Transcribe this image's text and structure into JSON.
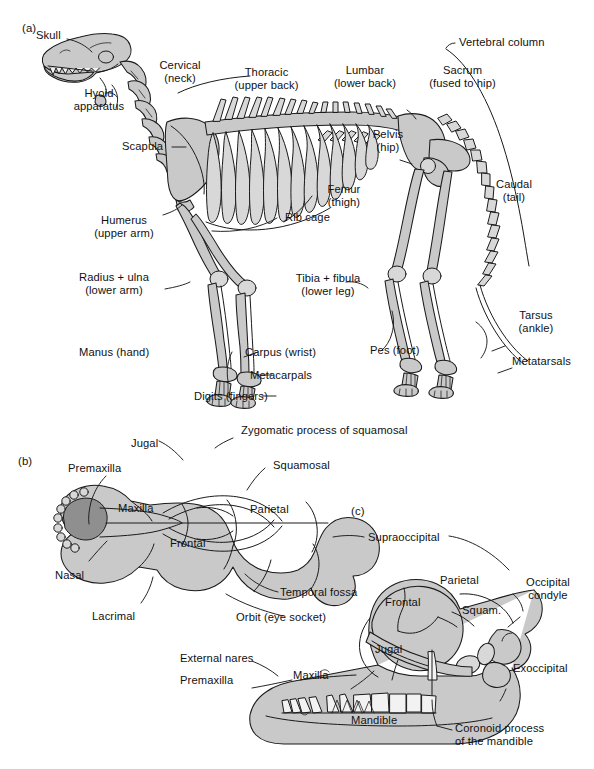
{
  "figure": {
    "background_color": "#ffffff",
    "bone_fill_color": "#c9c9c9",
    "bone_dark_fill_color": "#8f8f8f",
    "outline_color": "#1a1a1a",
    "text_color": "#111111"
  },
  "panels": {
    "a": {
      "tag": "(a)",
      "caption": "Whole skeleton, lateral view",
      "labels": [
        {
          "id": "skull",
          "text": "Skull"
        },
        {
          "id": "hyoid-apparatus",
          "text": "Hyoid\napparatus"
        },
        {
          "id": "scapula",
          "text": "Scapula"
        },
        {
          "id": "cervical",
          "text": "Cervical\n(neck)"
        },
        {
          "id": "thoracic",
          "text": "Thoracic\n(upper back)"
        },
        {
          "id": "lumbar",
          "text": "Lumbar\n(lower back)"
        },
        {
          "id": "sacrum",
          "text": "Sacrum\n(fused to hip)"
        },
        {
          "id": "vertebral-column",
          "text": "Vertebral column"
        },
        {
          "id": "pelvis",
          "text": "Pelvis\n(hip)"
        },
        {
          "id": "femur",
          "text": "Femur\n(thigh)"
        },
        {
          "id": "caudal",
          "text": "Caudal\n(tail)"
        },
        {
          "id": "rib-cage",
          "text": "Rib cage"
        },
        {
          "id": "humerus",
          "text": "Humerus\n(upper arm)"
        },
        {
          "id": "radius-ulna",
          "text": "Radius + ulna\n(lower arm)"
        },
        {
          "id": "manus",
          "text": "Manus (hand)"
        },
        {
          "id": "carpus",
          "text": "Carpus (wrist)"
        },
        {
          "id": "metacarpals",
          "text": "Metacarpals"
        },
        {
          "id": "digits",
          "text": "Digits (fingers)"
        },
        {
          "id": "tibia-fibula",
          "text": "Tibia + fibula\n(lower leg)"
        },
        {
          "id": "pes",
          "text": "Pes (foot)"
        },
        {
          "id": "tarsus",
          "text": "Tarsus\n(ankle)"
        },
        {
          "id": "metatarsals",
          "text": "Metatarsals"
        }
      ]
    },
    "b": {
      "tag": "(b)",
      "caption": "Skull, dorsal view",
      "labels": [
        {
          "id": "jugal",
          "text": "Jugal"
        },
        {
          "id": "zygomatic-process",
          "text": "Zygomatic process of squamosal"
        },
        {
          "id": "squamosal",
          "text": "Squamosal"
        },
        {
          "id": "premaxilla",
          "text": "Premaxilla"
        },
        {
          "id": "maxilla",
          "text": "Maxilla"
        },
        {
          "id": "parietal",
          "text": "Parietal"
        },
        {
          "id": "frontal",
          "text": "Frontal"
        },
        {
          "id": "nasal",
          "text": "Nasal"
        },
        {
          "id": "lacrimal",
          "text": "Lacrimal"
        },
        {
          "id": "temporal-fossa",
          "text": "Temporal fossa"
        },
        {
          "id": "orbit",
          "text": "Orbit (eye socket)"
        }
      ]
    },
    "c": {
      "tag": "(c)",
      "caption": "Skull, lateral view",
      "labels": [
        {
          "id": "supraoccipital",
          "text": "Supraoccipital"
        },
        {
          "id": "parietal",
          "text": "Parietal"
        },
        {
          "id": "frontal",
          "text": "Frontal"
        },
        {
          "id": "squam",
          "text": "Squam."
        },
        {
          "id": "occipital-condyle",
          "text": "Occipital\ncondyle"
        },
        {
          "id": "exoccipital",
          "text": "Exoccipital"
        },
        {
          "id": "jugal",
          "text": "Jugal"
        },
        {
          "id": "external-nares",
          "text": "External nares"
        },
        {
          "id": "premaxilla",
          "text": "Premaxilla"
        },
        {
          "id": "maxilla",
          "text": "Maxilla"
        },
        {
          "id": "mandible",
          "text": "Mandible"
        },
        {
          "id": "coronoid-process",
          "text": "Coronoid process\nof the mandible"
        }
      ]
    }
  }
}
